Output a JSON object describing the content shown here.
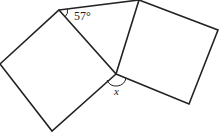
{
  "diagram": {
    "type": "geometry",
    "stroke_color": "#222222",
    "labels": {
      "angle_top": "57°",
      "angle_bottom": "x"
    },
    "shapes": {
      "left_square": [
        [
          59,
          10
        ],
        [
          116,
          74
        ],
        [
          52,
          131
        ],
        [
          0,
          64
        ]
      ],
      "right_square": [
        [
          139,
          0
        ],
        [
          218,
          30
        ],
        [
          189,
          104
        ],
        [
          116,
          74
        ]
      ],
      "triangle": [
        [
          59,
          10
        ],
        [
          139,
          0
        ],
        [
          116,
          74
        ]
      ]
    }
  }
}
